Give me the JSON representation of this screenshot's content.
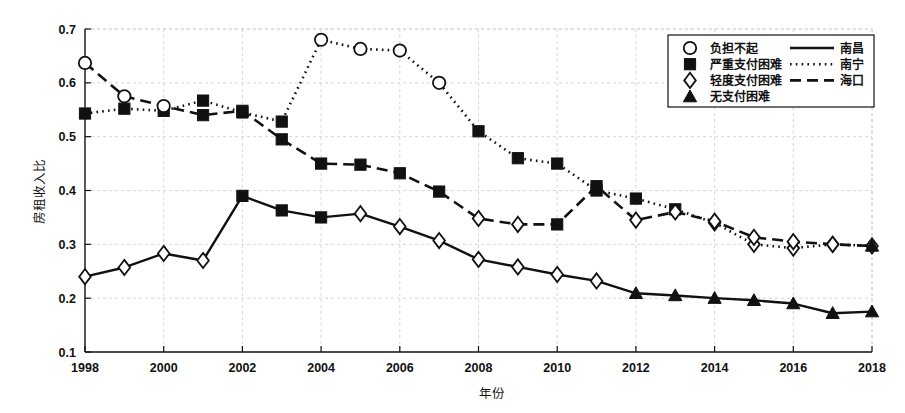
{
  "chart_data": {
    "type": "line",
    "title": "",
    "xlabel": "年份",
    "ylabel": "房租收入比",
    "xlim": [
      1998,
      2018
    ],
    "ylim": [
      0.1,
      0.7
    ],
    "grid": true,
    "legend_position": "top-right",
    "x": [
      1998,
      1999,
      2000,
      2001,
      2002,
      2003,
      2004,
      2005,
      2006,
      2007,
      2008,
      2009,
      2010,
      2011,
      2012,
      2013,
      2014,
      2015,
      2016,
      2017,
      2018
    ],
    "xticks": [
      1998,
      2000,
      2002,
      2004,
      2006,
      2008,
      2010,
      2012,
      2014,
      2016,
      2018
    ],
    "xtick_labels": [
      "1998",
      "2000",
      "2002",
      "2004",
      "2006",
      "2008",
      "2010",
      "2012",
      "2014",
      "2016",
      "2018"
    ],
    "yticks": [
      0.1,
      0.2,
      0.3,
      0.4,
      0.5,
      0.6,
      0.7
    ],
    "ytick_labels": [
      "0.1",
      "0.2",
      "0.3",
      "0.4",
      "0.5",
      "0.6",
      "0.7"
    ],
    "series": [
      {
        "name": "南昌",
        "line_style": "solid",
        "values": [
          0.24,
          0.257,
          0.283,
          0.27,
          0.39,
          0.363,
          0.35,
          0.357,
          0.333,
          0.307,
          0.272,
          0.258,
          0.244,
          0.232,
          0.209,
          0.205,
          0.2,
          0.196,
          0.19,
          0.172,
          0.175
        ],
        "markers": [
          "轻度支付困难",
          "轻度支付困难",
          "轻度支付困难",
          "轻度支付困难",
          "严重支付困难",
          "严重支付困难",
          "严重支付困难",
          "轻度支付困难",
          "轻度支付困难",
          "轻度支付困难",
          "轻度支付困难",
          "轻度支付困难",
          "轻度支付困难",
          "轻度支付困难",
          "无支付困难",
          "无支付困难",
          "无支付困难",
          "无支付困难",
          "无支付困难",
          "无支付困难",
          "无支付困难"
        ]
      },
      {
        "name": "南宁",
        "line_style": "dotted",
        "values": [
          0.543,
          0.552,
          0.548,
          0.567,
          0.545,
          0.528,
          0.68,
          0.663,
          0.66,
          0.6,
          0.51,
          0.46,
          0.45,
          0.4,
          0.385,
          0.365,
          0.34,
          0.3,
          0.293,
          0.3,
          0.297
        ],
        "markers": [
          "严重支付困难",
          "严重支付困难",
          "严重支付困难",
          "严重支付困难",
          "严重支付困难",
          "严重支付困难",
          "负担不起",
          "负担不起",
          "负担不起",
          "负担不起",
          "严重支付困难",
          "严重支付困难",
          "严重支付困难",
          "严重支付困难",
          "严重支付困难",
          "严重支付困难",
          "轻度支付困难",
          "轻度支付困难",
          "轻度支付困难",
          "轻度支付困难",
          "轻度支付困难"
        ]
      },
      {
        "name": "海口",
        "line_style": "dashed",
        "values": [
          0.637,
          0.575,
          0.557,
          0.54,
          0.548,
          0.495,
          0.45,
          0.448,
          0.432,
          0.398,
          0.348,
          0.337,
          0.337,
          0.408,
          0.345,
          0.36,
          0.343,
          0.313,
          0.305,
          0.3,
          0.297
        ],
        "markers": [
          "负担不起",
          "负担不起",
          "负担不起",
          "严重支付困难",
          "严重支付困难",
          "严重支付困难",
          "严重支付困难",
          "严重支付困难",
          "严重支付困难",
          "严重支付困难",
          "轻度支付困难",
          "轻度支付困难",
          "严重支付困难",
          "严重支付困难",
          "轻度支付困难",
          "轻度支付困难",
          "轻度支付困难",
          "轻度支付困难",
          "轻度支付困难",
          "轻度支付困难",
          "无支付困难"
        ]
      }
    ],
    "marker_legend": [
      {
        "symbol": "circle",
        "label": "负担不起"
      },
      {
        "symbol": "filled-square",
        "label": "严重支付困难"
      },
      {
        "symbol": "diamond",
        "label": "轻度支付困难"
      },
      {
        "symbol": "filled-triangle",
        "label": "无支付困难"
      }
    ],
    "line_legend": [
      {
        "style": "solid",
        "label": "南昌"
      },
      {
        "style": "dotted",
        "label": "南宁"
      },
      {
        "style": "dashed",
        "label": "海口"
      }
    ],
    "colors": {
      "ink": "#111111",
      "grid": "#cccccc",
      "background": "#ffffff"
    }
  }
}
